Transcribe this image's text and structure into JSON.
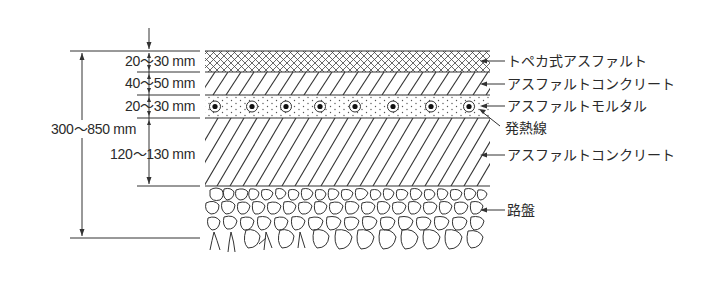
{
  "diagram": {
    "title": "",
    "type": "pavement cross-section (road heating)",
    "colors": {
      "line": "#333333",
      "background": "#ffffff"
    },
    "layers": [
      {
        "name": "トペカ式アスファルト",
        "thickness": "20〜30 mm",
        "pattern": "crosshatch"
      },
      {
        "name": "アスファルトコンクリート",
        "thickness": "40〜50 mm",
        "pattern": "diagonal"
      },
      {
        "name": "アスファルトモルタル",
        "thickness": "20〜30 mm",
        "pattern": "dotted",
        "embedded": "発熱線"
      },
      {
        "name": "アスファルトコンクリート",
        "thickness": "120〜130 mm",
        "pattern": "diagonal"
      },
      {
        "name": "路盤",
        "thickness": "",
        "pattern": "cobblestone"
      }
    ],
    "total_thickness": "300〜850 mm",
    "labels": {
      "l1": "トペカ式アスファルト",
      "l2": "アスファルトコンクリート",
      "l3": "アスファルトモルタル",
      "l4": "発熱線",
      "l5": "アスファルトコンクリート",
      "l6": "路盤"
    },
    "dimensions": {
      "d1": "20〜30 mm",
      "d2": "40〜50 mm",
      "d3": "20〜30 mm",
      "d4": "120〜130 mm",
      "total": "300〜850 mm"
    },
    "heating_wire_count": 8
  }
}
